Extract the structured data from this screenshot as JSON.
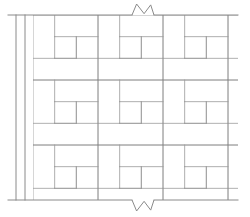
{
  "drawing": {
    "title": "Basketweave tile pattern section",
    "type": "parquet-basketweave",
    "background_color": "#ffffff",
    "line_color": "#9a9a9a",
    "heavy_line_color": "#8a8a8a",
    "line_width": 0.8,
    "canvas": {
      "width": 250,
      "height": 217
    }
  },
  "geometry": {
    "field": {
      "left": 33,
      "top": 15,
      "right": 238,
      "bottom": 200,
      "module_size": 65,
      "plank_width": 21.7,
      "modules_across": 3.15,
      "modules_down": 2.85,
      "clipped_right": true,
      "clipped_bottom": false
    },
    "wall_lines": [
      {
        "name": "outer-wall-line",
        "x": 16,
        "y1": 15,
        "y2": 200
      },
      {
        "name": "inner-wall-line",
        "x": 25,
        "y1": 15,
        "y2": 200
      }
    ],
    "boundary_lines": [
      {
        "name": "top-boundary",
        "y": 15,
        "x1": 8,
        "x2": 238
      },
      {
        "name": "bottom-boundary",
        "y": 200,
        "x1": 8,
        "x2": 238
      }
    ],
    "break_symbols": [
      {
        "name": "top-break-symbol",
        "cx": 143,
        "y": 15,
        "direction": "up",
        "width": 22,
        "amplitude": 11
      },
      {
        "name": "bottom-break-symbol",
        "cx": 143,
        "y": 200,
        "direction": "down",
        "width": 22,
        "amplitude": 11
      }
    ]
  },
  "chart_data": {
    "type": "table",
    "categories": [
      "module-row-1",
      "module-row-2",
      "module-row-3"
    ],
    "values": [
      3.15,
      3.15,
      2.85
    ],
    "xlabel": "modules across",
    "ylabel": "modules down"
  },
  "labels": {
    "pattern_name": "Basketweave",
    "note": ""
  }
}
